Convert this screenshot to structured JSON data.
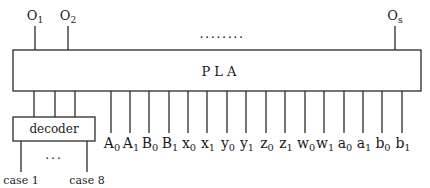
{
  "pla": {
    "label": "P L A",
    "box": {
      "x": 13,
      "y": 50,
      "w": 408,
      "h": 41
    }
  },
  "outputs": {
    "dots": "........",
    "items": [
      {
        "base": "O",
        "sub": "1",
        "x": 35
      },
      {
        "base": "O",
        "sub": "2",
        "x": 68
      },
      {
        "base": "O",
        "sub": "s",
        "x": 395
      }
    ]
  },
  "decoder": {
    "label": "decoder",
    "box": {
      "x": 13,
      "y": 117,
      "w": 82,
      "h": 24
    },
    "input_lines_x": [
      34,
      55,
      75
    ],
    "dots": "...",
    "cases": [
      {
        "label": "case 1",
        "x": 21
      },
      {
        "label": "case 8",
        "x": 87
      }
    ]
  },
  "inputs": [
    {
      "base": "A",
      "sub": "0",
      "x": 111
    },
    {
      "base": "A",
      "sub": "1",
      "x": 130
    },
    {
      "base": "B",
      "sub": "0",
      "x": 149
    },
    {
      "base": "B",
      "sub": "1",
      "x": 169
    },
    {
      "base": "x",
      "sub": "0",
      "x": 188
    },
    {
      "base": "x",
      "sub": "1",
      "x": 207
    },
    {
      "base": "y",
      "sub": "0",
      "x": 227
    },
    {
      "base": "y",
      "sub": "1",
      "x": 246
    },
    {
      "base": "z",
      "sub": "0",
      "x": 266
    },
    {
      "base": "z",
      "sub": "1",
      "x": 285
    },
    {
      "base": "w",
      "sub": "0",
      "x": 305
    },
    {
      "base": "w",
      "sub": "1",
      "x": 324
    },
    {
      "base": "a",
      "sub": "0",
      "x": 344
    },
    {
      "base": "a",
      "sub": "1",
      "x": 363
    },
    {
      "base": "b",
      "sub": "0",
      "x": 382
    },
    {
      "base": "b",
      "sub": "1",
      "x": 402
    }
  ]
}
